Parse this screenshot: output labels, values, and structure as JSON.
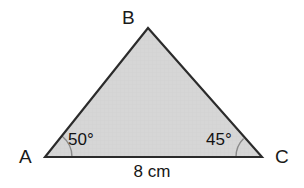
{
  "figure": {
    "type": "triangle-diagram",
    "width": 304,
    "height": 188,
    "background_color": "#ffffff",
    "fill_color": "#d6d6d6",
    "stroke_color": "#2b2b2b",
    "stroke_width": 2,
    "arc_color": "#6e6e6e"
  },
  "vertices": {
    "a": {
      "label": "A",
      "x": 45,
      "y": 157
    },
    "b": {
      "label": "B",
      "x": 148,
      "y": 28
    },
    "c": {
      "label": "C",
      "x": 262,
      "y": 157
    }
  },
  "angles": {
    "at_a": {
      "label": "50°",
      "value": 50,
      "unit": "degrees"
    },
    "at_c": {
      "label": "45°",
      "value": 45,
      "unit": "degrees"
    }
  },
  "sides": {
    "ac": {
      "label": "8 cm",
      "value": 8,
      "unit": "cm"
    }
  },
  "chart_data": {
    "type": "diagram",
    "title": "",
    "shape": "triangle",
    "points": [
      {
        "name": "A",
        "x": 45,
        "y": 157
      },
      {
        "name": "B",
        "x": 148,
        "y": 28
      },
      {
        "name": "C",
        "x": 262,
        "y": 157
      }
    ],
    "annotations": [
      {
        "at": "A",
        "text": "50°"
      },
      {
        "at": "C",
        "text": "45°"
      },
      {
        "at": "AC",
        "text": "8 cm"
      }
    ]
  }
}
